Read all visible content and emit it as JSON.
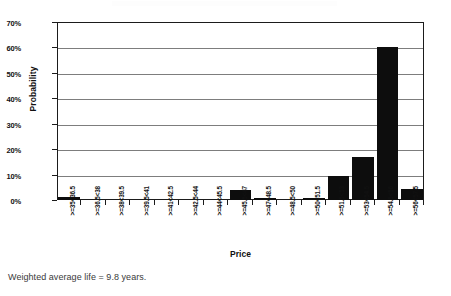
{
  "chart_data": {
    "type": "bar",
    "title": "",
    "xlabel": "Price",
    "ylabel": "Probability",
    "ylim": [
      0,
      70
    ],
    "yticks": [
      "0%",
      "10%",
      "20%",
      "30%",
      "40%",
      "50%",
      "60%",
      "70%"
    ],
    "ytick_values": [
      0,
      10,
      20,
      30,
      40,
      50,
      60,
      70
    ],
    "grid": "horizontal",
    "legend": "none",
    "categories": [
      ">=35<36.5",
      ">=36.5<38",
      ">=38<39.5",
      ">=39.5<41",
      ">=41<42.5",
      ">=42.5<44",
      ">=44<45.5",
      ">=45.5<47",
      ">=47<48.5",
      ">=48.5<50",
      ">=50<51.5",
      ">=51.5<53",
      ">=53<54.5",
      ">=54.5<56",
      ">=56<57.5"
    ],
    "values": [
      1,
      0,
      0,
      0,
      0,
      0,
      0,
      4,
      0.6,
      0,
      0.7,
      9.5,
      17,
      60,
      4.5
    ],
    "bar_color": "#0d0d0d",
    "axis_color": "#1b1b1b",
    "gridline_color": "#7d7d7d"
  },
  "caption": {
    "text": "Weighted average life = 9.8 years."
  }
}
